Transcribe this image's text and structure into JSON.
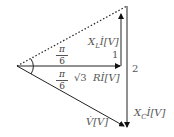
{
  "diagram": {
    "type": "phasor-diagram",
    "labels": {
      "xl_vector": "X",
      "xl_sub": "L",
      "xl_suffix": "İ[V]",
      "xc_vector": "X",
      "xc_sub": "C",
      "xc_suffix": "İ[V]",
      "r_prefix": "√3",
      "r_vector": "Rİ[V]",
      "v_vector": "V̇[V]",
      "length_1": "1",
      "length_2": "2",
      "angle_upper_num": "π",
      "angle_upper_den": "6",
      "angle_lower_num": "π",
      "angle_lower_den": "6"
    },
    "colors": {
      "line": "#222222",
      "label": "#555555"
    }
  }
}
